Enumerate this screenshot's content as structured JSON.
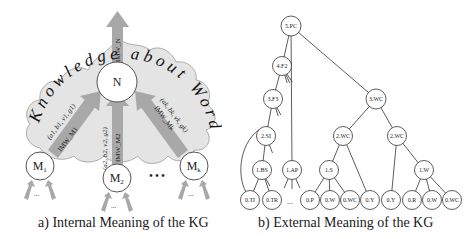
{
  "left_panel": {
    "caption": "a) Internal Meaning of the KG",
    "cloud_text": "Knowledge about Word",
    "center_node": "N",
    "top_arrow_label": "IMW_N",
    "input_nodes": [
      {
        "label": "M",
        "sub": "1",
        "tuple": "(a1, b1, v1, g1)",
        "arrow_label": "IMW_M1"
      },
      {
        "label": "M",
        "sub": "2",
        "tuple": "(a2, b2, v2, g2)",
        "arrow_label": "IMW_M2"
      },
      {
        "label": "M",
        "sub": "k",
        "tuple": "(ak, bk, vk, gk)",
        "arrow_label": "IMW_Mk"
      }
    ],
    "ellipsis": "• • •",
    "sub_ellipsis": "..."
  },
  "right_panel": {
    "caption": "b) External Meaning of the KG",
    "nodes": [
      {
        "id": "pc",
        "label": "5.PC"
      },
      {
        "id": "f2",
        "label": "4.F2"
      },
      {
        "id": "f3",
        "label": "3.F3"
      },
      {
        "id": "si",
        "label": "2.SI"
      },
      {
        "id": "bs",
        "label": "1.BS"
      },
      {
        "id": "ap",
        "label": "1.AP"
      },
      {
        "id": "wc3",
        "label": "3.WC"
      },
      {
        "id": "wc2a",
        "label": "2.WC"
      },
      {
        "id": "wc2b",
        "label": "2.WC"
      },
      {
        "id": "ls",
        "label": "1.S"
      },
      {
        "id": "iwc",
        "label": "1.W"
      },
      {
        "id": "ti",
        "label": "0.TI"
      },
      {
        "id": "tr",
        "label": "0.TR"
      },
      {
        "id": "p",
        "label": "0.P"
      },
      {
        "id": "w1",
        "label": "0.W"
      },
      {
        "id": "bwc1",
        "label": "0.WC"
      },
      {
        "id": "y1",
        "label": "0.Y"
      },
      {
        "id": "y2",
        "label": "0.Y"
      },
      {
        "id": "r",
        "label": "0.R"
      },
      {
        "id": "wa",
        "label": "0.W"
      },
      {
        "id": "bwc2",
        "label": "0.WC"
      }
    ],
    "ellipsis": "..."
  }
}
